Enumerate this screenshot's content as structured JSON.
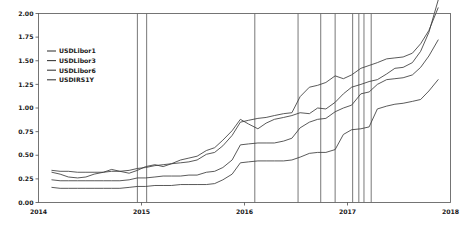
{
  "chart_data": {
    "type": "line",
    "title": "",
    "subtitle": "",
    "xlabel": "",
    "ylabel": "",
    "xlim": [
      2014.0,
      2018.0
    ],
    "ylim": [
      0.0,
      2.0
    ],
    "grid": false,
    "legend_position": "upper-left",
    "y_ticks": [
      "0.00",
      "0.25",
      "0.50",
      "0.75",
      "1.00",
      "1.25",
      "1.50",
      "1.75",
      "2.00"
    ],
    "y_tick_values": [
      0.0,
      0.25,
      0.5,
      0.75,
      1.0,
      1.25,
      1.5,
      1.75,
      2.0
    ],
    "x_ticks": [
      "2014",
      "2015",
      "2016",
      "2017",
      "2018"
    ],
    "x_tick_values": [
      2014,
      2015,
      2016,
      2017,
      2018
    ],
    "line_color": "#3c3c3c",
    "event_line_color": "#555555",
    "event_lines": [
      2014.96,
      2015.05,
      2016.1,
      2016.52,
      2016.74,
      2016.88,
      2017.05,
      2017.11,
      2017.16,
      2017.23
    ],
    "series": [
      {
        "name": "USDLibor1",
        "x": [
          2014.13,
          2014.21,
          2014.29,
          2014.38,
          2014.46,
          2014.54,
          2014.63,
          2014.71,
          2014.79,
          2014.88,
          2014.96,
          2015.04,
          2015.13,
          2015.21,
          2015.29,
          2015.38,
          2015.46,
          2015.54,
          2015.63,
          2015.71,
          2015.79,
          2015.88,
          2015.96,
          2016.04,
          2016.13,
          2016.21,
          2016.29,
          2016.38,
          2016.46,
          2016.54,
          2016.63,
          2016.71,
          2016.79,
          2016.88,
          2016.96,
          2017.04,
          2017.13,
          2017.21,
          2017.29,
          2017.38,
          2017.46,
          2017.54,
          2017.63,
          2017.71,
          2017.79,
          2017.88
        ],
        "values": [
          0.16,
          0.15,
          0.15,
          0.15,
          0.15,
          0.15,
          0.15,
          0.15,
          0.15,
          0.16,
          0.17,
          0.17,
          0.18,
          0.18,
          0.18,
          0.19,
          0.19,
          0.19,
          0.19,
          0.2,
          0.24,
          0.3,
          0.42,
          0.43,
          0.44,
          0.44,
          0.44,
          0.44,
          0.45,
          0.48,
          0.52,
          0.53,
          0.53,
          0.56,
          0.72,
          0.77,
          0.78,
          0.8,
          0.99,
          1.02,
          1.04,
          1.05,
          1.07,
          1.09,
          1.18,
          1.3
        ]
      },
      {
        "name": "USDLibor3",
        "x": [
          2014.13,
          2014.21,
          2014.29,
          2014.38,
          2014.46,
          2014.54,
          2014.63,
          2014.71,
          2014.79,
          2014.88,
          2014.96,
          2015.04,
          2015.13,
          2015.21,
          2015.29,
          2015.38,
          2015.46,
          2015.54,
          2015.63,
          2015.71,
          2015.79,
          2015.88,
          2015.96,
          2016.04,
          2016.13,
          2016.21,
          2016.29,
          2016.38,
          2016.46,
          2016.54,
          2016.63,
          2016.71,
          2016.79,
          2016.88,
          2016.96,
          2017.04,
          2017.13,
          2017.21,
          2017.29,
          2017.38,
          2017.46,
          2017.54,
          2017.63,
          2017.71,
          2017.79,
          2017.88
        ],
        "values": [
          0.24,
          0.23,
          0.23,
          0.23,
          0.23,
          0.23,
          0.23,
          0.23,
          0.23,
          0.24,
          0.26,
          0.26,
          0.27,
          0.28,
          0.28,
          0.28,
          0.29,
          0.29,
          0.32,
          0.33,
          0.37,
          0.45,
          0.61,
          0.62,
          0.63,
          0.63,
          0.63,
          0.65,
          0.68,
          0.79,
          0.85,
          0.88,
          0.89,
          0.96,
          1.0,
          1.03,
          1.15,
          1.17,
          1.25,
          1.3,
          1.31,
          1.32,
          1.35,
          1.43,
          1.55,
          1.72
        ]
      },
      {
        "name": "USDLibor6",
        "x": [
          2014.13,
          2014.21,
          2014.29,
          2014.38,
          2014.46,
          2014.54,
          2014.63,
          2014.71,
          2014.79,
          2014.88,
          2014.96,
          2015.04,
          2015.13,
          2015.21,
          2015.29,
          2015.38,
          2015.46,
          2015.54,
          2015.63,
          2015.71,
          2015.79,
          2015.88,
          2015.96,
          2016.04,
          2016.13,
          2016.21,
          2016.29,
          2016.38,
          2016.46,
          2016.54,
          2016.63,
          2016.71,
          2016.79,
          2016.88,
          2016.96,
          2017.04,
          2017.13,
          2017.21,
          2017.29,
          2017.38,
          2017.46,
          2017.54,
          2017.63,
          2017.71,
          2017.79,
          2017.88
        ],
        "values": [
          0.34,
          0.33,
          0.33,
          0.32,
          0.32,
          0.32,
          0.32,
          0.33,
          0.33,
          0.34,
          0.36,
          0.37,
          0.39,
          0.4,
          0.41,
          0.42,
          0.43,
          0.45,
          0.51,
          0.53,
          0.6,
          0.71,
          0.85,
          0.87,
          0.89,
          0.9,
          0.92,
          0.94,
          0.95,
          1.12,
          1.22,
          1.24,
          1.27,
          1.34,
          1.31,
          1.35,
          1.42,
          1.45,
          1.48,
          1.52,
          1.53,
          1.54,
          1.58,
          1.68,
          1.82,
          2.06
        ]
      },
      {
        "name": "USDIRS1Y",
        "x": [
          2014.13,
          2014.21,
          2014.29,
          2014.38,
          2014.46,
          2014.54,
          2014.63,
          2014.71,
          2014.79,
          2014.88,
          2014.96,
          2015.04,
          2015.13,
          2015.21,
          2015.29,
          2015.38,
          2015.46,
          2015.54,
          2015.63,
          2015.71,
          2015.79,
          2015.88,
          2015.96,
          2016.04,
          2016.13,
          2016.21,
          2016.29,
          2016.38,
          2016.46,
          2016.54,
          2016.63,
          2016.71,
          2016.79,
          2016.88,
          2016.96,
          2017.04,
          2017.13,
          2017.21,
          2017.29,
          2017.38,
          2017.46,
          2017.54,
          2017.63,
          2017.71,
          2017.79,
          2017.88
        ],
        "values": [
          0.32,
          0.3,
          0.27,
          0.26,
          0.27,
          0.3,
          0.32,
          0.35,
          0.33,
          0.31,
          0.34,
          0.38,
          0.4,
          0.38,
          0.41,
          0.45,
          0.47,
          0.49,
          0.55,
          0.58,
          0.66,
          0.76,
          0.88,
          0.83,
          0.78,
          0.84,
          0.88,
          0.9,
          0.92,
          0.95,
          0.94,
          1.0,
          0.99,
          1.06,
          1.15,
          1.22,
          1.25,
          1.28,
          1.3,
          1.36,
          1.42,
          1.43,
          1.48,
          1.6,
          1.8,
          2.14
        ]
      }
    ]
  },
  "legend": {
    "items": [
      {
        "label": "USDLibor1"
      },
      {
        "label": "USDLibor3"
      },
      {
        "label": "USDLibor6"
      },
      {
        "label": "USDIRS1Y"
      }
    ]
  }
}
